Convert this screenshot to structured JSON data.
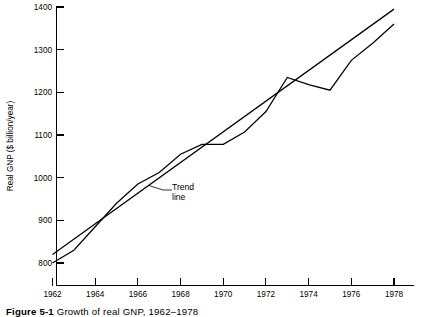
{
  "figure": {
    "caption_label": "Figure 5-1",
    "caption_text": "Growth of real GNP, 1962–1978"
  },
  "annotations": {
    "trend_line_1": "Trend",
    "trend_line_2": "line"
  },
  "axes": {
    "ylabel": "Real GNP ($ billion/year)",
    "xlabel": "",
    "ytick_labels": [
      "800",
      "900",
      "1000",
      "1100",
      "1200",
      "1300",
      "1400"
    ],
    "xtick_labels": [
      "1962",
      "1964",
      "1966",
      "1968",
      "1970",
      "1972",
      "1974",
      "1976",
      "1978"
    ]
  },
  "chart_data": {
    "type": "line",
    "title": "Growth of real GNP, 1962–1978",
    "xlabel": "",
    "ylabel": "Real GNP ($ billion/year)",
    "xlim": [
      1962,
      1978
    ],
    "ylim": [
      800,
      1400
    ],
    "yticks": [
      800,
      900,
      1000,
      1100,
      1200,
      1300,
      1400
    ],
    "xticks": [
      1962,
      1964,
      1966,
      1968,
      1970,
      1972,
      1974,
      1976,
      1978
    ],
    "grid": false,
    "legend": "none",
    "x": [
      1962,
      1963,
      1964,
      1965,
      1966,
      1967,
      1968,
      1969,
      1970,
      1971,
      1972,
      1973,
      1974,
      1975,
      1976,
      1977,
      1978
    ],
    "series": [
      {
        "name": "Real GNP",
        "values": [
          800,
          830,
          885,
          940,
          985,
          1012,
          1055,
          1078,
          1078,
          1107,
          1155,
          1235,
          1218,
          1205,
          1275,
          1315,
          1360
        ]
      },
      {
        "name": "Trend line",
        "values": [
          820,
          856,
          892,
          928,
          964,
          1000,
          1036,
          1072,
          1108,
          1144,
          1180,
          1216,
          1252,
          1288,
          1323,
          1359,
          1395
        ]
      }
    ],
    "annotations": [
      {
        "text": "Trend line",
        "x": 1967.1,
        "y": 962
      }
    ]
  }
}
